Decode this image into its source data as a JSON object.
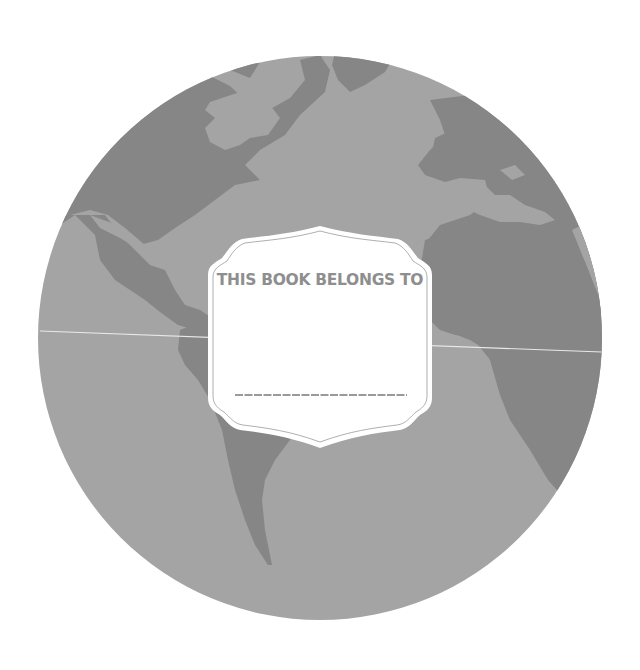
{
  "bookplate": {
    "heading": "THIS BOOK BELONGS TO",
    "name_line_placeholder": ""
  },
  "colors": {
    "background": "#ffffff",
    "ocean": "#a4a4a4",
    "land": "#868686",
    "label_fill": "#ffffff",
    "label_text": "#8e8e8e",
    "equator_line": "#e8e8e8"
  },
  "icons": {
    "globe": "world-globe-illustration"
  }
}
